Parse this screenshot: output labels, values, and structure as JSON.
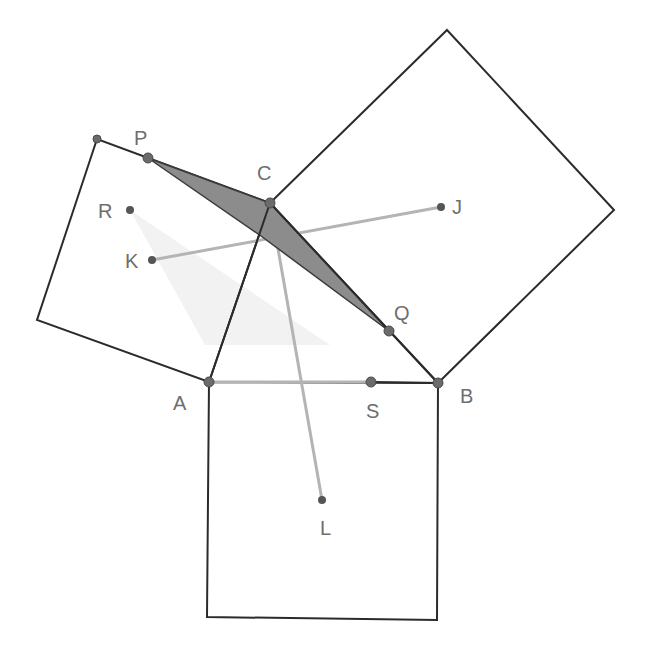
{
  "diagram": {
    "title": "",
    "colors": {
      "edge": "#2b2b2b",
      "auxiliary_segment": "#b4b4b4",
      "shaded_region": "#8a8a8a",
      "faint_region": "#f1f1f1",
      "point": "#6b6b6b",
      "label": "#6e6e6e"
    },
    "points": {
      "A": {
        "label": "A",
        "x": 209,
        "y": 382
      },
      "B": {
        "label": "B",
        "x": 438,
        "y": 383
      },
      "C": {
        "label": "C",
        "x": 270,
        "y": 203
      },
      "P": {
        "label": "P",
        "x": 148,
        "y": 158
      },
      "Q": {
        "label": "Q",
        "x": 389,
        "y": 331
      },
      "R": {
        "label": "R",
        "x": 130,
        "y": 210
      },
      "S": {
        "label": "S",
        "x": 371,
        "y": 382
      },
      "J": {
        "label": "J",
        "x": 441,
        "y": 207
      },
      "K": {
        "label": "K",
        "x": 152,
        "y": 260
      },
      "L": {
        "label": "L",
        "x": 322,
        "y": 500
      }
    },
    "squares": [
      {
        "name": "square-on-AC",
        "vertices": [
          [
            209,
            382
          ],
          [
            270,
            203
          ],
          [
            97,
            139
          ],
          [
            37,
            320
          ]
        ]
      },
      {
        "name": "square-on-CB",
        "vertices": [
          [
            270,
            203
          ],
          [
            447,
            30
          ],
          [
            614,
            210
          ],
          [
            438,
            383
          ]
        ]
      },
      {
        "name": "square-on-AB",
        "vertices": [
          [
            209,
            382
          ],
          [
            438,
            383
          ],
          [
            437,
            620
          ],
          [
            207,
            617
          ]
        ]
      }
    ],
    "shaded_polygon": [
      [
        148,
        158
      ],
      [
        270,
        203
      ],
      [
        389,
        331
      ],
      [
        261,
        236
      ]
    ],
    "faint_polygon": [
      [
        130,
        210
      ],
      [
        330,
        345
      ],
      [
        205,
        345
      ]
    ],
    "segments": [
      {
        "from": "K",
        "to": "J",
        "style": "auxiliary"
      },
      {
        "from": "C",
        "to": "L",
        "style": "auxiliary"
      },
      {
        "from": "A",
        "to": "S",
        "style": "auxiliary"
      },
      {
        "from": "S",
        "to": "B",
        "style": "edge"
      }
    ]
  }
}
